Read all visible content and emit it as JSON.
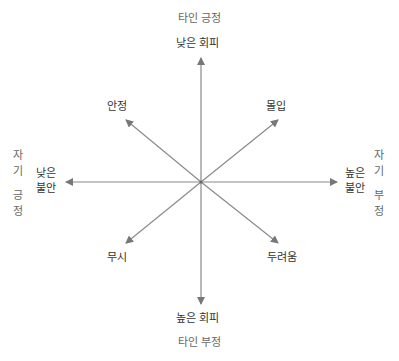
{
  "diagram": {
    "axes": {
      "top": {
        "title": "타인 긍정",
        "pole": "낮은 회피"
      },
      "bottom": {
        "pole": "높은 회피",
        "title": "타인 부정"
      },
      "left": {
        "title_chars": [
          "자",
          "기",
          "",
          "긍",
          "정"
        ],
        "pole_lines": [
          "낮은",
          "불안"
        ]
      },
      "right": {
        "title_chars": [
          "자",
          "기",
          "",
          "부",
          "정"
        ],
        "pole_lines": [
          "높은",
          "불안"
        ]
      }
    },
    "quadrants": {
      "upper_left": "안정",
      "upper_right": "몰입",
      "lower_left": "무시",
      "lower_right": "두려움"
    },
    "colors": {
      "arrow": "#8a8a8a",
      "text": "#333333",
      "title_text": "#666666"
    }
  }
}
